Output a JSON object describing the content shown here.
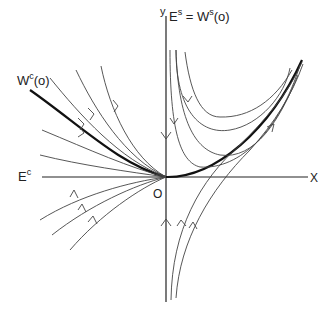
{
  "labels": {
    "y_axis": "y",
    "x_axis": "X",
    "origin": "O",
    "stable_space_E": "E",
    "stable_space_E_sup": "s",
    "stable_eq": " = W",
    "stable_manifold_sup": "s",
    "stable_manifold_arg": "(o)",
    "center_space": "E",
    "center_space_sup": "c",
    "center_manifold": "W",
    "center_manifold_sup": "c",
    "center_manifold_arg": "(o)"
  },
  "colors": {
    "ink": "#222222",
    "background": "#ffffff"
  }
}
